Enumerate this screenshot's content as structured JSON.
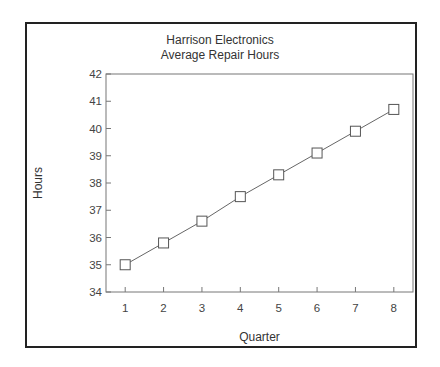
{
  "chart_data": {
    "type": "line",
    "title": "Harrison Electronics",
    "subtitle": "Average Repair Hours",
    "xlabel": "Quarter",
    "ylabel": "Hours",
    "x": [
      1,
      2,
      3,
      4,
      5,
      6,
      7,
      8
    ],
    "series": [
      {
        "name": "Average Repair Hours",
        "values": [
          35.0,
          35.8,
          36.6,
          37.5,
          38.3,
          39.1,
          39.9,
          40.7
        ],
        "marker": "square"
      }
    ],
    "xlim": [
      0.5,
      8.5
    ],
    "ylim": [
      34,
      42
    ],
    "xticks": [
      1,
      2,
      3,
      4,
      5,
      6,
      7,
      8
    ],
    "yticks": [
      34,
      35,
      36,
      37,
      38,
      39,
      40,
      41,
      42
    ],
    "grid": false,
    "legend": "none"
  }
}
